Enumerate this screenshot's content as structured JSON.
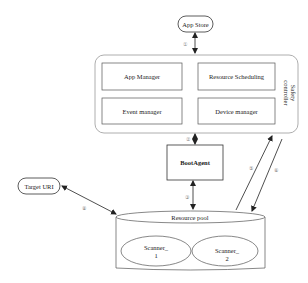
{
  "diagram": {
    "app_store": {
      "label": "App Store"
    },
    "safety_controller": {
      "label_line1": "Safety",
      "label_line2": "controller",
      "modules": [
        {
          "label": "App Manager"
        },
        {
          "label": "Resource Scheduling"
        },
        {
          "label": "Event manager"
        },
        {
          "label": "Device manager"
        }
      ]
    },
    "boot_agent": {
      "label": "BootAgent"
    },
    "target_uri": {
      "label": "Target URI"
    },
    "resource_pool": {
      "label": "Resource pool",
      "scanners": [
        {
          "line1": "Scanner_",
          "line2": "1"
        },
        {
          "line1": "Scanner_",
          "line2": "2"
        }
      ]
    },
    "steps": {
      "s1": "①",
      "s2": "②",
      "s3": "③",
      "s5": "⑤",
      "s6": "⑥",
      "s8": "⑧"
    },
    "colors": {
      "stroke": "#333333",
      "soft_stroke": "#999999",
      "background": "#ffffff"
    }
  }
}
